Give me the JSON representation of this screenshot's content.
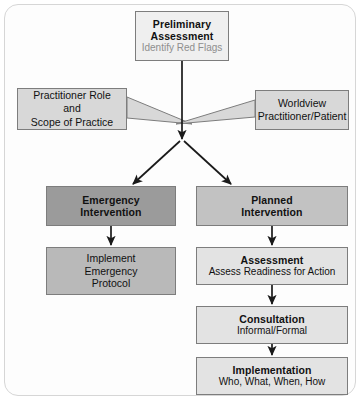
{
  "diagram": {
    "colors": {
      "frame_border": "#d6d6d6",
      "node_border": "#7d7d7d",
      "arrow": "#1a1a1a",
      "preliminary_fill": "#efefef",
      "emergency_fill": "#9b9b9b",
      "implement_fill": "#b9b9b9",
      "planned_fill": "#c2c2c2",
      "step_fill": "#e3e3e3",
      "callout_fill": "#d8d8d8",
      "muted_text": "#8e8e8e"
    },
    "nodes": {
      "preliminary": {
        "title_line1": "Preliminary",
        "title_line2": "Assessment",
        "subtitle": "Identify Red Flags"
      },
      "practitioner_callout": {
        "line1": "Practitioner Role",
        "line2": "and",
        "line3": "Scope of Practice"
      },
      "worldview_callout": {
        "line1": "Worldview",
        "line2": "Practitioner/Patient"
      },
      "emergency": {
        "title_line1": "Emergency",
        "title_line2": "Intervention"
      },
      "implement_protocol": {
        "line1": "Implement",
        "line2": "Emergency",
        "line3": "Protocol"
      },
      "planned": {
        "title_line1": "Planned",
        "title_line2": "Intervention"
      },
      "assessment": {
        "title": "Assessment",
        "subtitle": "Assess Readiness for Action"
      },
      "consultation": {
        "title": "Consultation",
        "subtitle": "Informal/Formal"
      },
      "implementation": {
        "title": "Implementation",
        "subtitle": "Who, What, When, How"
      }
    },
    "connectors": [
      {
        "name": "preliminary-to-junction",
        "from": "preliminary",
        "to": "junction"
      },
      {
        "name": "practitioner-callout-tail",
        "from": "practitioner_callout",
        "to": "junction"
      },
      {
        "name": "worldview-callout-tail",
        "from": "worldview_callout",
        "to": "junction"
      },
      {
        "name": "junction-to-emergency",
        "from": "junction",
        "to": "emergency"
      },
      {
        "name": "junction-to-planned",
        "from": "junction",
        "to": "planned"
      },
      {
        "name": "emergency-to-implement-protocol",
        "from": "emergency",
        "to": "implement_protocol"
      },
      {
        "name": "planned-to-assessment",
        "from": "planned",
        "to": "assessment"
      },
      {
        "name": "assessment-to-consultation",
        "from": "assessment",
        "to": "consultation"
      },
      {
        "name": "consultation-to-implementation",
        "from": "consultation",
        "to": "implementation"
      }
    ]
  }
}
